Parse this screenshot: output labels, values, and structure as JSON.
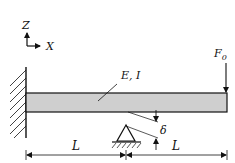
{
  "diagram": {
    "type": "cantilever-beam-with-support",
    "axes": {
      "z_label": "Z",
      "x_label": "X"
    },
    "beam": {
      "label": "E, I",
      "fill_color": "#cfcfcf",
      "stroke_color": "#111111"
    },
    "load": {
      "label": "F",
      "subscript": "0"
    },
    "gap": {
      "label": "δ"
    },
    "dimensions": [
      {
        "label": "L"
      },
      {
        "label": "L"
      }
    ]
  }
}
